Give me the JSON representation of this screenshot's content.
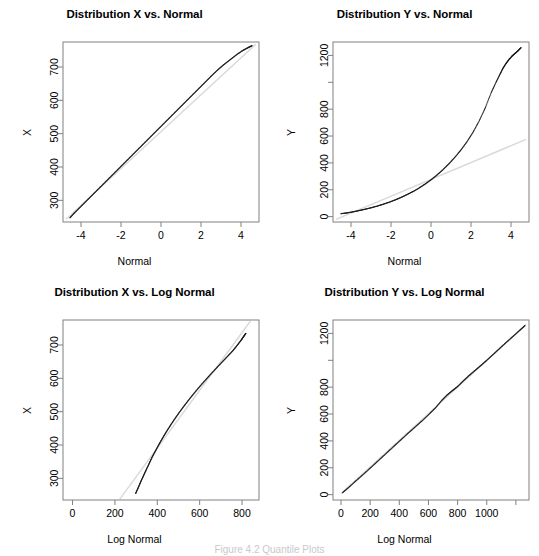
{
  "figure": {
    "background": "#ffffff",
    "axis_color": "#808080",
    "data_color": "#1a1a1a",
    "reference_color": "#d9d9d9",
    "caption": "Figure 4.2 Quantile Plots"
  },
  "chart_data": [
    {
      "id": "dist-x-vs-normal",
      "type": "scatter",
      "title": "Distribution X vs. Normal",
      "xlabel": "Normal",
      "ylabel": "X",
      "grid": false,
      "legend": "none",
      "xlim": [
        -4.9,
        4.9
      ],
      "ylim": [
        235,
        775
      ],
      "xticks": [
        -4,
        -2,
        0,
        2,
        4
      ],
      "xticklabels": [
        "-4",
        "-2",
        "0",
        "2",
        "4"
      ],
      "yticks": [
        300,
        400,
        500,
        600,
        700
      ],
      "yticklabels": [
        "300",
        "400",
        "500",
        "600",
        "700"
      ],
      "series": [
        {
          "name": "quantiles",
          "x": [
            -4.55,
            -4.3,
            -4.0,
            -3.7,
            -3.4,
            -3.1,
            -2.8,
            -2.5,
            -2.2,
            -1.9,
            -1.6,
            -1.3,
            -1.0,
            -0.7,
            -0.4,
            -0.1,
            0.2,
            0.5,
            0.8,
            1.1,
            1.4,
            1.7,
            2.0,
            2.3,
            2.6,
            2.9,
            3.2,
            3.5,
            3.8,
            4.1,
            4.35,
            4.55
          ],
          "y": [
            248,
            264,
            282,
            300,
            318,
            336,
            354,
            372,
            390,
            408,
            426,
            444,
            462,
            480,
            498,
            516,
            534,
            552,
            570,
            588,
            606,
            624,
            642,
            660,
            678,
            695,
            710,
            724,
            738,
            750,
            758,
            764
          ]
        },
        {
          "name": "reference-line",
          "x": [
            -4.75,
            4.75
          ],
          "y": [
            243,
            769
          ]
        }
      ]
    },
    {
      "id": "dist-y-vs-normal",
      "type": "scatter",
      "title": "Distribution Y vs. Normal",
      "xlabel": "Normal",
      "ylabel": "Y",
      "grid": false,
      "legend": "none",
      "xlim": [
        -4.9,
        4.9
      ],
      "ylim": [
        -40,
        1300
      ],
      "xticks": [
        -4,
        -2,
        0,
        2,
        4
      ],
      "xticklabels": [
        "-4",
        "-2",
        "0",
        "2",
        "4"
      ],
      "yticks": [
        0,
        200,
        400,
        600,
        800,
        1000,
        1200
      ],
      "yticklabels": [
        "0",
        "200",
        "400",
        "600",
        "800",
        "",
        "1200"
      ],
      "series": [
        {
          "name": "quantiles",
          "x": [
            -4.5,
            -4.2,
            -3.9,
            -3.6,
            -3.3,
            -3.0,
            -2.7,
            -2.4,
            -2.1,
            -1.8,
            -1.5,
            -1.2,
            -0.9,
            -0.6,
            -0.3,
            0.0,
            0.3,
            0.6,
            0.9,
            1.2,
            1.5,
            1.8,
            2.1,
            2.4,
            2.7,
            3.0,
            3.25,
            3.45,
            3.6,
            3.75,
            3.9,
            4.05,
            4.2,
            4.35,
            4.5
          ],
          "y": [
            22,
            28,
            36,
            45,
            55,
            66,
            78,
            92,
            107,
            124,
            143,
            164,
            187,
            213,
            242,
            274,
            310,
            350,
            394,
            443,
            497,
            558,
            628,
            710,
            805,
            920,
            1000,
            1060,
            1105,
            1140,
            1170,
            1195,
            1215,
            1235,
            1258
          ]
        },
        {
          "name": "reference-line",
          "x": [
            -4.75,
            4.75
          ],
          "y": [
            -20,
            575
          ]
        }
      ]
    },
    {
      "id": "dist-x-vs-lognormal",
      "type": "scatter",
      "title": "Distribution X vs. Log Normal",
      "xlabel": "Log Normal",
      "ylabel": "X",
      "grid": false,
      "legend": "none",
      "xlim": [
        -45,
        880
      ],
      "ylim": [
        235,
        775
      ],
      "xticks": [
        0,
        200,
        400,
        600,
        800
      ],
      "xticklabels": [
        "0",
        "200",
        "400",
        "600",
        "800"
      ],
      "yticks": [
        300,
        400,
        500,
        600,
        700
      ],
      "yticklabels": [
        "300",
        "400",
        "500",
        "600",
        "700"
      ],
      "series": [
        {
          "name": "quantiles",
          "x": [
            298,
            310,
            322,
            335,
            348,
            362,
            376,
            392,
            408,
            425,
            443,
            462,
            482,
            503,
            525,
            548,
            572,
            597,
            623,
            650,
            678,
            706,
            733,
            758,
            778,
            795,
            808,
            818
          ],
          "y": [
            255,
            272,
            290,
            308,
            326,
            345,
            364,
            383,
            402,
            421,
            440,
            459,
            478,
            497,
            516,
            535,
            554,
            573,
            592,
            611,
            630,
            649,
            667,
            684,
            700,
            714,
            726,
            735
          ]
        },
        {
          "name": "reference-line",
          "x": [
            222,
            840
          ],
          "y": [
            237,
            772
          ]
        }
      ]
    },
    {
      "id": "dist-y-vs-lognormal",
      "type": "scatter",
      "title": "Distribution Y vs. Log Normal",
      "xlabel": "Log Normal",
      "ylabel": "Y",
      "grid": false,
      "legend": "none",
      "xlim": [
        -55,
        1290
      ],
      "ylim": [
        -40,
        1300
      ],
      "xticks": [
        0,
        200,
        400,
        600,
        800,
        1000,
        1200
      ],
      "xticklabels": [
        "0",
        "200",
        "400",
        "600",
        "800",
        "1000",
        ""
      ],
      "yticks": [
        0,
        200,
        400,
        600,
        800,
        1000,
        1200
      ],
      "yticklabels": [
        "0",
        "200",
        "400",
        "600",
        "800",
        "",
        "1200"
      ],
      "series": [
        {
          "name": "quantiles",
          "x": [
            10,
            55,
            105,
            155,
            205,
            255,
            305,
            355,
            405,
            455,
            505,
            555,
            605,
            650,
            690,
            728,
            765,
            800,
            840,
            880,
            920,
            960,
            1000,
            1045,
            1090,
            1135,
            1180,
            1225,
            1262
          ],
          "y": [
            14,
            56,
            105,
            153,
            202,
            252,
            302,
            352,
            402,
            452,
            500,
            548,
            600,
            648,
            700,
            742,
            775,
            805,
            848,
            888,
            925,
            962,
            1000,
            1045,
            1090,
            1135,
            1178,
            1222,
            1258
          ]
        },
        {
          "name": "reference-line",
          "x": [
            0,
            1272
          ],
          "y": [
            8,
            1268
          ]
        }
      ]
    }
  ]
}
